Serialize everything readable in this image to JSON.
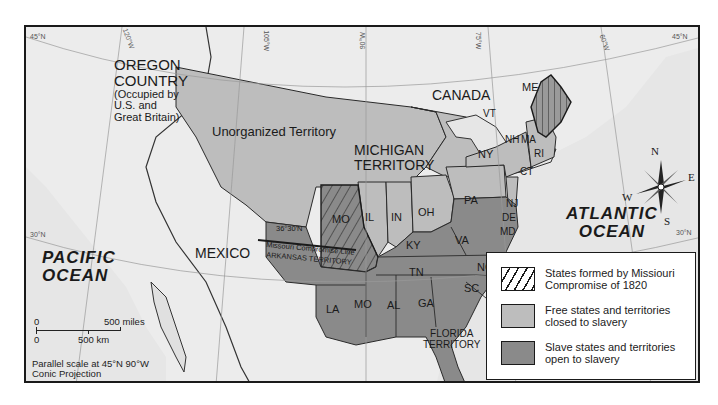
{
  "map": {
    "title_regions": {
      "oregon": {
        "line1": "OREGON",
        "line2": "COUNTRY",
        "note1": "(Occupied by",
        "note2": "U.S. and",
        "note3": "Great Britain)"
      },
      "unorganized": "Unorganized Territory",
      "michigan": {
        "line1": "MICHIGAN",
        "line2": "TERRITORY"
      },
      "canada": "CANADA",
      "mexico": "MEXICO",
      "arkansas": "ARKANSAS TERRITORY",
      "florida": {
        "line1": "FLORIDA",
        "line2": "TERRITORY"
      }
    },
    "oceans": {
      "pacific": {
        "line1": "PACIFIC",
        "line2": "OCEAN"
      },
      "atlantic": {
        "line1": "ATLANTIC",
        "line2": "OCEAN"
      }
    },
    "states": {
      "me": "ME",
      "vt": "VT",
      "nh": "NH",
      "ma": "MA",
      "ri": "RI",
      "ct": "CT",
      "ny": "NY",
      "nj": "NJ",
      "pa": "PA",
      "de": "DE",
      "md": "MD",
      "il": "IL",
      "in": "IN",
      "oh": "OH",
      "mo": "MO",
      "ky": "KY",
      "va": "VA",
      "tn": "TN",
      "nc": "NC",
      "sc": "SC",
      "la": "LA",
      "ms": "MO",
      "al": "AL",
      "ga": "GA"
    },
    "compromise_line": {
      "latitude": "36°30'N",
      "label": "Missouri Compromise Line"
    },
    "graticule": {
      "lat_45_left": "45°N",
      "lat_45_right": "45°N",
      "lat_30_left": "30°N",
      "lat_30_right": "30°N",
      "lon_120": "120°W",
      "lon_105": "105°W",
      "lon_90": "90°W",
      "lon_75": "75°W",
      "lon_60": "60°W"
    },
    "compass": {
      "n": "N",
      "s": "S",
      "e": "E",
      "w": "W"
    },
    "scale": {
      "miles_zero": "0",
      "miles_label": "500 miles",
      "km_zero": "0",
      "km_label": "500 km",
      "note1": "Parallel scale at 45°N 90°W",
      "note2": "Conic Projection"
    },
    "colors": {
      "water": "#e6e6e6",
      "free": "#bdbdbd",
      "slave": "#8a8a8a",
      "other_land": "#ececec",
      "border": "#2a2a2a"
    }
  },
  "legend": {
    "items": [
      {
        "label": "States formed by Missiouri Compromise of 1820",
        "pattern": "hatched"
      },
      {
        "label": "Free states and territories closed to slavery",
        "color": "#bdbdbd"
      },
      {
        "label": "Slave states and territories open to slavery",
        "color": "#8a8a8a"
      }
    ]
  }
}
